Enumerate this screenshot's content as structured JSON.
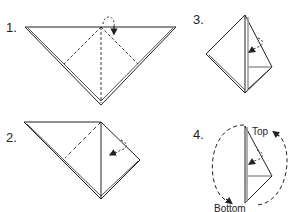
{
  "diagram": {
    "type": "origami-instructions",
    "steps": [
      {
        "number": "1.",
        "description": "Triangle with dashed fold lines, fold top corner down"
      },
      {
        "number": "2.",
        "description": "Fold right flap toward center"
      },
      {
        "number": "3.",
        "description": "Fold flap inward"
      },
      {
        "number": "4.",
        "description": "Rotate model",
        "labels": {
          "top": "Top",
          "bottom": "Bottom"
        }
      }
    ]
  },
  "colors": {
    "line": "#222222",
    "background": "#ffffff"
  }
}
